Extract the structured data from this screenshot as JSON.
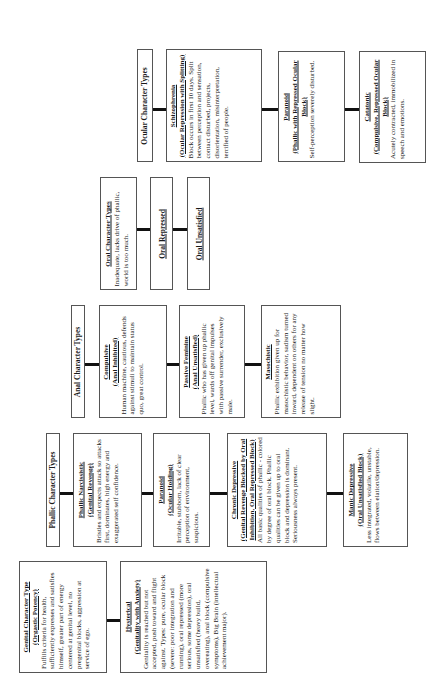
{
  "diagram": {
    "rows": [
      {
        "header": {
          "label": "Ocular Character Types"
        },
        "items": [
          {
            "title": "Schizophrenia",
            "subtitle": "(Ocular Repression with Splitting)",
            "description": "Block occurs in first 10 days. Split between perception and sensation, contact disturbed, projects, disorientation, misinterpretation, terrified of people."
          },
          {
            "title": "Paranoid",
            "subtitle": "(Phallic with Repressed Ocular Block)",
            "description": "Self-perception severely disturbed."
          },
          {
            "title": "Catatonic",
            "subtitle": "(Compulsive, Repressed Ocular Block)",
            "description": "Acutely contracted, immobilized in speech and emotions."
          }
        ]
      },
      {
        "header": {
          "label": "Oral Character Types",
          "description": "Inadequate, lacks drive of phallic, world is too much."
        },
        "items": [
          {
            "title": "Oral Repressed"
          },
          {
            "title": "Oral Unsatisfied"
          }
        ]
      },
      {
        "header": {
          "label": "Anal Character Types"
        },
        "items": [
          {
            "title": "Compulsive",
            "subtitle": "(Anal Inhibited)",
            "description": "Human machine, cautious, defends against stimuli to maintain status quo, great control."
          },
          {
            "title": "Passive Feminine",
            "subtitle": "(Anal Unsatisfied)",
            "description": "Phallic who has given up phallic level, wards off genital impulses with passive surrender, exclusively male."
          },
          {
            "title": "Masochistic",
            "description": "Phallic exhibition given up for masochistic behavior, sadism turned inward, dependent on others for any release of tension no matter how slight."
          }
        ]
      },
      {
        "header": {
          "label": "Phallic Character Types"
        },
        "items": [
          {
            "title": "Phallic Narcissistic",
            "subtitle": "(Genital Revenge)",
            "description": "Bristles and expects attack so attacks first, dominates, high energy and exaggerated self confidence."
          },
          {
            "title": "Paranoid",
            "subtitle": "(Ocular Holding)",
            "description": "Irritable, stubborn, lack of clear perception of environment, suspicious."
          },
          {
            "title": "Chronic Depressive",
            "subtitle": "(Genital Revenge Blocked by Oral Inhibition, Oral Repressed Block)",
            "description": "All basic qualities of phallic - colored by degree of oral block. Phallic qualities can be given up to oral block and depression is dominant. Seriousness always present."
          },
          {
            "title": "Manic Depressive",
            "subtitle": "(Oral Unsatisfied Block)",
            "description": "Less integrated, volatile, unstable, flows between elation/depression."
          }
        ]
      },
      {
        "header": {
          "label": "Genital Character Type",
          "subtitle": "(Orgastic Potency)",
          "description": "Fulfills criteria for health, sufficiently expresses and satisfies himself, greater part of energy centered at genital level, no pregenital blocks, aggression at service of ego."
        },
        "items": [
          {
            "title": "Hysterical",
            "subtitle": "(Genitality with Anxiety)",
            "description": "Genitality is reached but not accepted, push toward and flight against. Types: pure, ocular block (severe: poor integration and running), oral repressed (more serious, some depression), oral unsatisfied (heavy build, overeating), anal block (compulsive symptoms), Big Brain (intellectual achievement major)."
          }
        ]
      }
    ]
  }
}
